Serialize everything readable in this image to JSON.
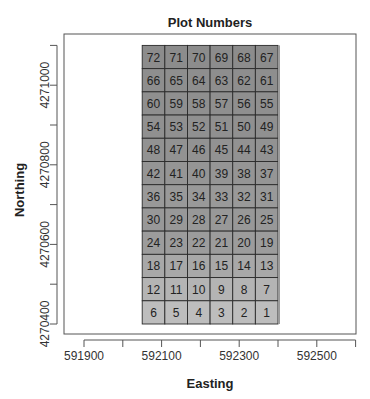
{
  "chart_data": {
    "type": "heatmap",
    "title": "Plot Numbers",
    "xlabel": "Easting",
    "ylabel": "Northing",
    "xlim": [
      591850,
      592600
    ],
    "ylim": [
      4270375,
      4271130
    ],
    "x_ticks": [
      591900,
      592000,
      592100,
      592200,
      592300,
      592400,
      592500,
      592600
    ],
    "x_tick_labels": [
      "591900",
      "",
      "592100",
      "",
      "592300",
      "",
      "592500",
      ""
    ],
    "y_ticks": [
      4270400,
      4270500,
      4270600,
      4270700,
      4270800,
      4270900,
      4271000,
      4271100
    ],
    "y_tick_labels": [
      "4270400",
      "",
      "4270600",
      "",
      "4270800",
      "",
      "4271000",
      ""
    ],
    "grid": false,
    "legend": "none",
    "plot_grid": {
      "x_min": 592050,
      "x_max": 592400,
      "y_min": 4270400,
      "y_max": 4271100,
      "columns": 6,
      "rows": 12,
      "row_labels_top_to_bottom": [
        [
          "72",
          "71",
          "70",
          "69",
          "68",
          "67"
        ],
        [
          "66",
          "65",
          "64",
          "63",
          "62",
          "61"
        ],
        [
          "60",
          "59",
          "58",
          "57",
          "56",
          "55"
        ],
        [
          "54",
          "53",
          "52",
          "51",
          "50",
          "49"
        ],
        [
          "48",
          "47",
          "46",
          "45",
          "44",
          "43"
        ],
        [
          "42",
          "41",
          "40",
          "39",
          "38",
          "37"
        ],
        [
          "36",
          "35",
          "34",
          "33",
          "32",
          "31"
        ],
        [
          "30",
          "29",
          "28",
          "27",
          "26",
          "25"
        ],
        [
          "24",
          "23",
          "22",
          "21",
          "20",
          "19"
        ],
        [
          "18",
          "17",
          "16",
          "15",
          "14",
          "13"
        ],
        [
          "12",
          "11",
          "10",
          "9",
          "8",
          "7"
        ],
        [
          "6",
          "5",
          "4",
          "3",
          "2",
          "1"
        ]
      ],
      "row_shades_top_to_bottom": [
        "#8c8c8c",
        "#8e8e8e",
        "#8f8f8f",
        "#909090",
        "#929292",
        "#959595",
        "#999999",
        "#989898",
        "#9c9c9c",
        "#a8a8a8",
        "#b4b4b4",
        "#bdbdbd"
      ]
    }
  }
}
